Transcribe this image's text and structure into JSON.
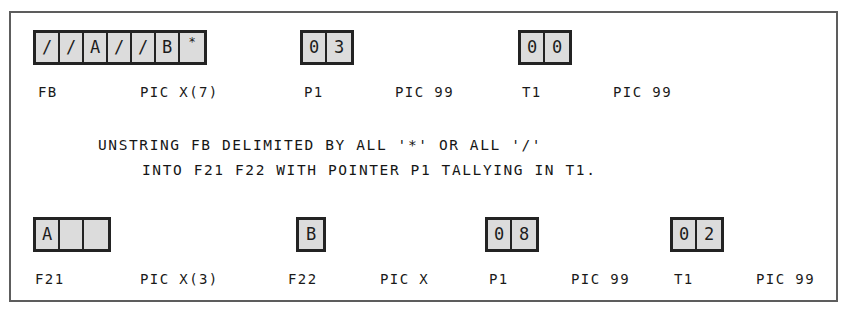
{
  "page": {
    "header_remnant_left": "",
    "header_remnant_right": "",
    "frame_title": "COBOL UNSTRING statement illustration"
  },
  "diagram": {
    "type": "cobol-unstring-before-after",
    "statement": {
      "line1": "UNSTRING FB DELIMITED BY ALL '*' OR ALL '/'",
      "line2": "INTO F21 F22 WITH POINTER P1 TALLYING IN T1."
    },
    "before_row": {
      "fields": [
        {
          "name": "FB",
          "picture": "PIC X(7)",
          "cells": [
            "/",
            "/",
            "A",
            "/",
            "/",
            "B",
            "*"
          ]
        },
        {
          "name": "P1",
          "picture": "PIC 99",
          "cells": [
            "0",
            "3"
          ]
        },
        {
          "name": "T1",
          "picture": "PIC 99",
          "cells": [
            "0",
            "0"
          ]
        }
      ]
    },
    "after_row": {
      "fields": [
        {
          "name": "F21",
          "picture": "PIC X(3)",
          "cells": [
            "A",
            "",
            ""
          ]
        },
        {
          "name": "F22",
          "picture": "PIC X",
          "cells": [
            "B"
          ]
        },
        {
          "name": "P1",
          "picture": "PIC 99",
          "cells": [
            "0",
            "8"
          ]
        },
        {
          "name": "T1",
          "picture": "PIC 99",
          "cells": [
            "0",
            "2"
          ]
        }
      ]
    }
  },
  "colors": {
    "frame_border": "#5d5d5d",
    "cell_border": "#232323",
    "cell_fill": "#dcdcdc",
    "text": "#1a1a1a",
    "background": "#ffffff"
  }
}
